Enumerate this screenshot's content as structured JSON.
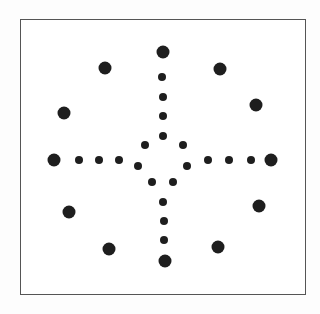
{
  "diagram": {
    "frame": {
      "x": 20,
      "y": 19,
      "w": 286,
      "h": 276,
      "stroke": "#555555"
    },
    "dot_color": "#1e1e1e",
    "large_dots": [
      {
        "x": 163,
        "y": 52,
        "r": 6.5
      },
      {
        "x": 105,
        "y": 68,
        "r": 6.5
      },
      {
        "x": 220,
        "y": 69,
        "r": 6.5
      },
      {
        "x": 64,
        "y": 113,
        "r": 6.5
      },
      {
        "x": 256,
        "y": 105,
        "r": 6.5
      },
      {
        "x": 54,
        "y": 160,
        "r": 6.5
      },
      {
        "x": 271,
        "y": 160,
        "r": 6.5
      },
      {
        "x": 69,
        "y": 212,
        "r": 6.5
      },
      {
        "x": 259,
        "y": 206,
        "r": 6.5
      },
      {
        "x": 109,
        "y": 249,
        "r": 6.5
      },
      {
        "x": 218,
        "y": 247,
        "r": 6.5
      },
      {
        "x": 165,
        "y": 261,
        "r": 6.5
      }
    ],
    "small_dots": [
      {
        "x": 162,
        "y": 77,
        "r": 4
      },
      {
        "x": 163,
        "y": 97,
        "r": 4
      },
      {
        "x": 163,
        "y": 116,
        "r": 4
      },
      {
        "x": 163,
        "y": 136,
        "r": 4
      },
      {
        "x": 145,
        "y": 145,
        "r": 4
      },
      {
        "x": 183,
        "y": 145,
        "r": 4
      },
      {
        "x": 79,
        "y": 160,
        "r": 4
      },
      {
        "x": 99,
        "y": 160,
        "r": 4
      },
      {
        "x": 119,
        "y": 160,
        "r": 4
      },
      {
        "x": 208,
        "y": 160,
        "r": 4
      },
      {
        "x": 229,
        "y": 160,
        "r": 4
      },
      {
        "x": 251,
        "y": 160,
        "r": 4
      },
      {
        "x": 138,
        "y": 166,
        "r": 4
      },
      {
        "x": 187,
        "y": 166,
        "r": 4
      },
      {
        "x": 152,
        "y": 182,
        "r": 4
      },
      {
        "x": 173,
        "y": 182,
        "r": 4
      },
      {
        "x": 163,
        "y": 202,
        "r": 4
      },
      {
        "x": 164,
        "y": 221,
        "r": 4
      },
      {
        "x": 164,
        "y": 240,
        "r": 4
      }
    ]
  }
}
